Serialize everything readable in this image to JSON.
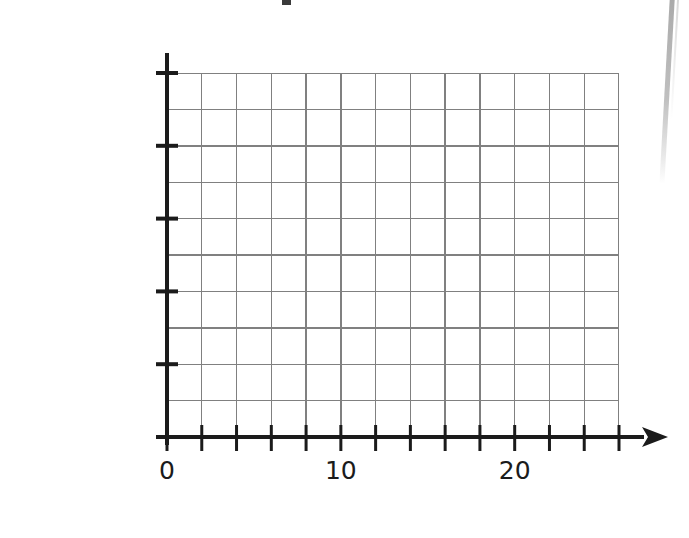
{
  "chart_data": {
    "type": "bar",
    "orientation": "horizontal",
    "title": "",
    "xlabel": "",
    "ylabel": "",
    "categories": [
      "Tennis",
      "Drama",
      "Dance",
      "Swimming",
      "Football"
    ],
    "values": [
      null,
      null,
      null,
      null,
      null
    ],
    "note": "Blank answer grid - no bars drawn",
    "x_tick_labels": [
      "0",
      "10",
      "20"
    ],
    "x_tick_values": [
      0,
      10,
      20
    ],
    "x_minor_tick_step": 2,
    "xlim": [
      0,
      26
    ],
    "grid": true,
    "grid_columns": 13,
    "grid_rows": 10,
    "legend": null,
    "axis_arrow": "right"
  },
  "axes": {
    "y_category_labels": [
      {
        "text": "Football",
        "index": 4
      },
      {
        "text": "Swimming",
        "index": 3
      },
      {
        "text": "Dance",
        "index": 2
      },
      {
        "text": "Drama",
        "index": 1
      },
      {
        "text": "Tennis",
        "index": 0
      }
    ],
    "x_tick_labels": [
      {
        "text": "0",
        "value": 0
      },
      {
        "text": "10",
        "value": 10
      },
      {
        "text": "20",
        "value": 20
      }
    ]
  },
  "colors": {
    "background": "#ffffff",
    "grid_line": "#808080",
    "axis_line": "#1b1b1b",
    "text": "#1b1b1b",
    "page_edge": "#a8a8a8"
  }
}
